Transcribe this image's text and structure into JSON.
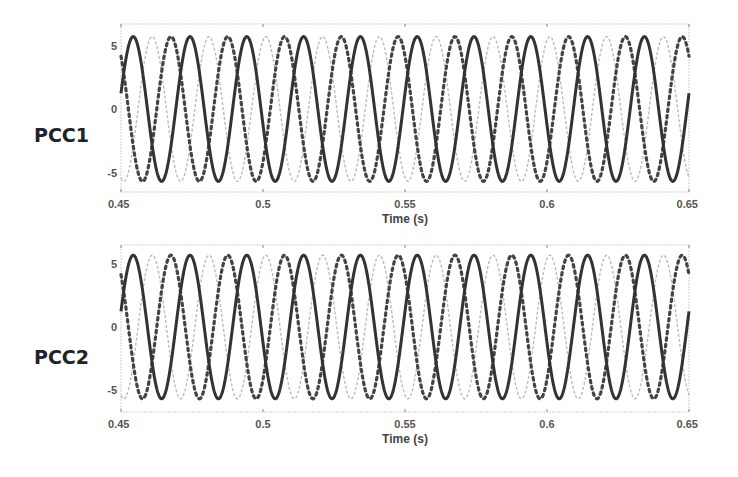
{
  "chart_data": [
    {
      "type": "line",
      "panel_label": "PCC1",
      "title": "",
      "xlabel": "Time (s)",
      "ylabel": "",
      "xlim": [
        0.45,
        0.65
      ],
      "ylim": [
        -6.6,
        6.6
      ],
      "xticks": [
        0.45,
        0.5,
        0.55,
        0.6,
        0.65
      ],
      "xtick_labels": [
        "0.45",
        "0.5",
        "0.55",
        "0.6",
        "0.65"
      ],
      "yticks": [
        5,
        0,
        -5
      ],
      "ytick_labels": [
        "5",
        "0",
        "-5"
      ],
      "grid": false,
      "legend": null,
      "frequency_hz": 50,
      "series": [
        {
          "name": "Phase A",
          "style": "solid",
          "color": "#333333",
          "amplitude": 5.7,
          "phase_deg": 0,
          "peak_time": 0.4543
        },
        {
          "name": "Phase B",
          "style": "light-dashed",
          "color": "#bbbbbb",
          "amplitude": 5.7,
          "phase_deg": -120,
          "peak_time": 0.461
        },
        {
          "name": "Phase C",
          "style": "dark-dotted",
          "color": "#444444",
          "amplitude": 5.7,
          "phase_deg": -240,
          "peak_time": 0.4676
        }
      ]
    },
    {
      "type": "line",
      "panel_label": "PCC2",
      "title": "",
      "xlabel": "Time (s)",
      "ylabel": "",
      "xlim": [
        0.45,
        0.65
      ],
      "ylim": [
        -6.6,
        6.6
      ],
      "xticks": [
        0.45,
        0.5,
        0.55,
        0.6,
        0.65
      ],
      "xtick_labels": [
        "0.45",
        "0.5",
        "0.55",
        "0.6",
        "0.65"
      ],
      "yticks": [
        5,
        0,
        -5
      ],
      "ytick_labels": [
        "5",
        "0",
        "-5"
      ],
      "grid": false,
      "legend": null,
      "frequency_hz": 50,
      "series": [
        {
          "name": "Phase A",
          "style": "solid",
          "color": "#333333",
          "amplitude": 5.7,
          "phase_deg": 0,
          "peak_time": 0.4543
        },
        {
          "name": "Phase B",
          "style": "light-dashed",
          "color": "#bbbbbb",
          "amplitude": 5.7,
          "phase_deg": -120,
          "peak_time": 0.461
        },
        {
          "name": "Phase C",
          "style": "dark-dotted",
          "color": "#444444",
          "amplitude": 5.7,
          "phase_deg": -240,
          "peak_time": 0.4676
        }
      ]
    }
  ],
  "panels": [
    {
      "label": "PCC1",
      "xlabel": "Time (s)"
    },
    {
      "label": "PCC2",
      "xlabel": "Time (s)"
    }
  ]
}
